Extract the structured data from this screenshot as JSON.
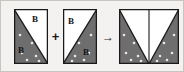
{
  "figure": {
    "background_color": "#f4f2f0",
    "border_color": "#c9c6c2",
    "shape_fill_color": "#6e6e6e",
    "shape_empty_color": "#ffffff",
    "outline_color": "#1a1a1a",
    "dot_color": "#e8e8e8",
    "width": 184,
    "height": 72
  },
  "separators": {
    "plus": "+",
    "arrow": "→"
  },
  "panels": [
    {
      "id": "panel-left",
      "x": 13,
      "y": 8,
      "w": 34,
      "h": 55,
      "labels": [
        {
          "text": "B",
          "x": 31,
          "y": 14
        },
        {
          "text": "B",
          "x": 17,
          "y": 45
        }
      ],
      "polygon_filled": "0,0 0,55 34,55",
      "polygon_empty": "0,0 34,55 34,0",
      "diagonal": "0,0 34,55",
      "dots": [
        {
          "cx": 6,
          "cy": 26
        },
        {
          "cx": 18,
          "cy": 34
        },
        {
          "cx": 8,
          "cy": 44
        },
        {
          "cx": 22,
          "cy": 47
        },
        {
          "cx": 13,
          "cy": 51
        },
        {
          "cx": 25,
          "cy": 52
        }
      ]
    },
    {
      "id": "panel-middle",
      "x": 62,
      "y": 8,
      "w": 34,
      "h": 55,
      "labels": [
        {
          "text": "B",
          "x": 67,
          "y": 16
        },
        {
          "text": "B",
          "x": 82,
          "y": 47
        }
      ],
      "polygon_filled": "34,0 34,55 0,55",
      "polygon_empty": "0,0 34,0 0,55",
      "diagonal": "34,0 0,55",
      "dots": [
        {
          "cx": 28,
          "cy": 26
        },
        {
          "cx": 16,
          "cy": 34
        },
        {
          "cx": 26,
          "cy": 44
        },
        {
          "cx": 12,
          "cy": 47
        },
        {
          "cx": 21,
          "cy": 51
        },
        {
          "cx": 9,
          "cy": 52
        }
      ]
    },
    {
      "id": "panel-result",
      "x": 118,
      "y": 8,
      "w": 60,
      "h": 55,
      "labels": [],
      "polygon_filled_left": "0,0 0,55 30,55",
      "polygon_filled_right": "60,0 60,55 30,55",
      "polygon_empty": "0,0 30,55 60,0",
      "diagonal_left": "0,0 30,55",
      "diagonal_right": "60,0 30,55",
      "center_line": "30,0 30,55",
      "dots": [
        {
          "cx": 5,
          "cy": 26
        },
        {
          "cx": 15,
          "cy": 34
        },
        {
          "cx": 7,
          "cy": 44
        },
        {
          "cx": 19,
          "cy": 47
        },
        {
          "cx": 12,
          "cy": 51
        },
        {
          "cx": 22,
          "cy": 52
        },
        {
          "cx": 55,
          "cy": 26
        },
        {
          "cx": 45,
          "cy": 34
        },
        {
          "cx": 53,
          "cy": 44
        },
        {
          "cx": 41,
          "cy": 47
        },
        {
          "cx": 48,
          "cy": 51
        },
        {
          "cx": 38,
          "cy": 52
        }
      ]
    }
  ]
}
